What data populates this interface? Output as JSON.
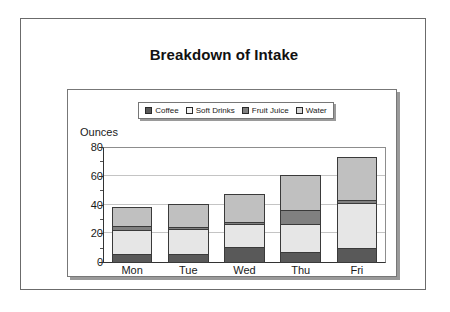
{
  "slide": {
    "title": "Breakdown of Intake"
  },
  "chart_data": {
    "type": "bar",
    "subtype": "stacked-bar",
    "title": "Breakdown of Intake",
    "xlabel": "",
    "ylabel": "Ounces",
    "ylim": [
      0,
      80
    ],
    "yticks": [
      0,
      20,
      40,
      60,
      80
    ],
    "ytick_labels": [
      "0",
      "20",
      "40",
      "60",
      "80"
    ],
    "grid": true,
    "legend_position": "top",
    "categories": [
      "Mon",
      "Tue",
      "Wed",
      "Thu",
      "Fri"
    ],
    "series": [
      {
        "name": "Coffee",
        "color": "#595959",
        "values": [
          6,
          6,
          11,
          7,
          10
        ]
      },
      {
        "name": "Soft Drinks",
        "color": "#e6e6e6",
        "values": [
          17,
          18,
          16,
          20,
          32
        ]
      },
      {
        "name": "Fruit Juice",
        "color": "#808080",
        "values": [
          3,
          1,
          2,
          10,
          2
        ]
      },
      {
        "name": "Water",
        "color": "#c0c0c0",
        "values": [
          13,
          16,
          19,
          24,
          30
        ]
      }
    ],
    "totals": [
      39,
      41,
      48,
      61,
      74
    ]
  }
}
